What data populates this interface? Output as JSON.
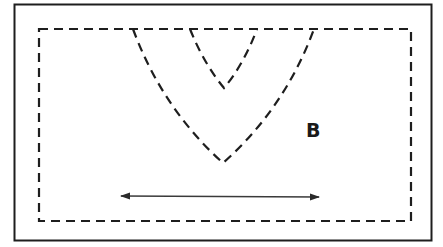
{
  "diagram": {
    "region_label": "B",
    "colors": {
      "stroke": "#1e1e1e",
      "background": "#ffffff"
    },
    "shapes": {
      "outer_frame": "solid rectangle",
      "inner_frame": "dashed rectangle",
      "outer_v": "dashed curved V",
      "inner_v": "dashed curved V",
      "arrow": "double-headed horizontal arrow"
    }
  }
}
